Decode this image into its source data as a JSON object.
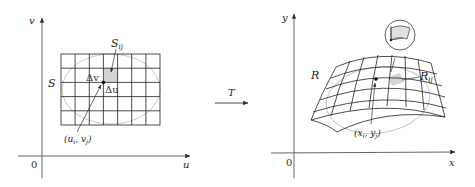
{
  "left_plot": {
    "axis_vertical_label": "v",
    "axis_horizontal_label": "u",
    "origin_label": "0",
    "region_label": "S",
    "subrect_label_main": "S",
    "subrect_label_sub": "ij",
    "delta_v_label": "Δv",
    "delta_u_label": "Δu",
    "point_label": "(u",
    "point_label_i": "i",
    "point_label_mid": ", v",
    "point_label_j": "j",
    "point_label_end": ")",
    "grid_cols": 7,
    "grid_rows": 5,
    "shaded_color": "#d4d4d4"
  },
  "transform": {
    "label": "T"
  },
  "right_plot": {
    "axis_vertical_label": "y",
    "axis_horizontal_label": "x",
    "origin_label": "0",
    "region_label": "R",
    "subregion_label_main": "R",
    "subregion_label_sub": "ij",
    "point_label": "(x",
    "point_label_i": "i",
    "point_label_mid": ", y",
    "point_label_j": "j",
    "point_label_end": ")",
    "shaded_color": "#d4d4d4"
  }
}
